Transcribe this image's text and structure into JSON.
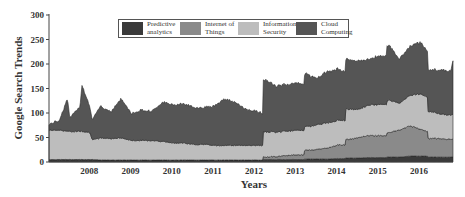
{
  "chart_data": {
    "type": "area",
    "stacked": true,
    "title": "",
    "xlabel": "Years",
    "ylabel": "Google Search Trends",
    "ylim": [
      0,
      300
    ],
    "xlim": [
      2007.0,
      2016.8
    ],
    "yticks": [
      0,
      50,
      100,
      150,
      200,
      250,
      300
    ],
    "xticks": [
      "2008",
      "2009",
      "2010",
      "2011",
      "2012",
      "2013",
      "2014",
      "2015",
      "2016"
    ],
    "grid": false,
    "legend_position": "top-center",
    "x": [
      2007.0,
      2007.25,
      2007.45,
      2007.5,
      2007.75,
      2007.8,
      2008.0,
      2008.05,
      2008.25,
      2008.5,
      2008.75,
      2009.0,
      2009.25,
      2009.5,
      2009.75,
      2010.0,
      2010.25,
      2010.5,
      2010.75,
      2011.0,
      2011.25,
      2011.5,
      2011.75,
      2012.0,
      2012.18,
      2012.2,
      2012.25,
      2012.5,
      2012.75,
      2013.0,
      2013.18,
      2013.2,
      2013.25,
      2013.5,
      2013.75,
      2014.0,
      2014.18,
      2014.2,
      2014.25,
      2014.5,
      2014.75,
      2015.0,
      2015.18,
      2015.2,
      2015.25,
      2015.5,
      2015.75,
      2016.0,
      2016.18,
      2016.2,
      2016.25,
      2016.5,
      2016.75,
      2016.8
    ],
    "series": [
      {
        "name": "Predictive analytics",
        "color": "#3a3a3a",
        "values": [
          5,
          5,
          5,
          5,
          5,
          5,
          5,
          5,
          4,
          4,
          4,
          4,
          4,
          4,
          4,
          4,
          4,
          4,
          4,
          4,
          4,
          4,
          4,
          4,
          4,
          5,
          5,
          5,
          5,
          5,
          5,
          6,
          6,
          6,
          6,
          7,
          7,
          8,
          8,
          8,
          9,
          9,
          9,
          10,
          10,
          10,
          12,
          12,
          12,
          10,
          10,
          10,
          10,
          10
        ]
      },
      {
        "name": "Internet of Things",
        "color": "#8a8a8a",
        "values": [
          0,
          0,
          0,
          0,
          0,
          0,
          0,
          0,
          0,
          0,
          0,
          0,
          0,
          0,
          0,
          0,
          0,
          0,
          0,
          0,
          0,
          0,
          0,
          0,
          0,
          5,
          5,
          6,
          8,
          10,
          10,
          18,
          18,
          20,
          22,
          28,
          28,
          38,
          38,
          42,
          45,
          45,
          45,
          50,
          50,
          55,
          62,
          55,
          50,
          38,
          38,
          38,
          36,
          36
        ]
      },
      {
        "name": "Information Security",
        "color": "#bdbdbd",
        "values": [
          60,
          60,
          58,
          57,
          58,
          58,
          55,
          40,
          45,
          44,
          45,
          40,
          40,
          40,
          38,
          35,
          35,
          32,
          32,
          30,
          30,
          30,
          30,
          30,
          30,
          52,
          52,
          50,
          50,
          50,
          50,
          48,
          48,
          50,
          52,
          50,
          50,
          62,
          62,
          58,
          62,
          64,
          64,
          66,
          66,
          55,
          62,
          72,
          70,
          55,
          55,
          50,
          50,
          50
        ]
      },
      {
        "name": "Cloud Computing",
        "color": "#555555",
        "values": [
          12,
          20,
          67,
          28,
          50,
          95,
          50,
          40,
          65,
          55,
          80,
          55,
          62,
          60,
          80,
          78,
          80,
          76,
          75,
          80,
          95,
          88,
          75,
          70,
          65,
          105,
          105,
          94,
          95,
          96,
          95,
          108,
          108,
          94,
          105,
          105,
          100,
          102,
          102,
          98,
          94,
          98,
          100,
          112,
          112,
          90,
          100,
          105,
          95,
          85,
          85,
          90,
          90,
          109
        ]
      }
    ]
  },
  "legend": {
    "items": [
      {
        "label_1": "Predictive",
        "label_2": "analytics",
        "color": "#3a3a3a"
      },
      {
        "label_1": "Internet of",
        "label_2": "Things",
        "color": "#8a8a8a"
      },
      {
        "label_1": "Information",
        "label_2": "Security",
        "color": "#bdbdbd"
      },
      {
        "label_1": "Cloud",
        "label_2": "Computing",
        "color": "#555555"
      }
    ]
  },
  "axes": {
    "y_title": "Google Search Trends",
    "x_title": "Years"
  }
}
